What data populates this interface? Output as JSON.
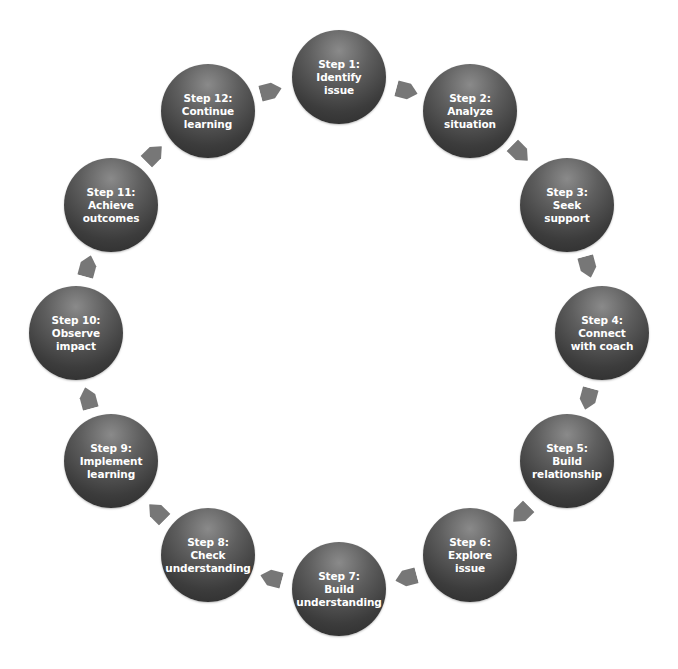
{
  "diagram": {
    "type": "cycle",
    "colors": {
      "circle_dark": "#2a2a2a",
      "circle_light": "#8a8a8a",
      "arrow": "#777777",
      "text": "#ffffff",
      "background": "#ffffff"
    },
    "steps": [
      {
        "title": "Step 1:",
        "line1": "Identify",
        "line2": "issue"
      },
      {
        "title": "Step 2:",
        "line1": "Analyze",
        "line2": "situation"
      },
      {
        "title": "Step 3:",
        "line1": "Seek",
        "line2": "support"
      },
      {
        "title": "Step 4:",
        "line1": "Connect",
        "line2": "with coach"
      },
      {
        "title": "Step 5:",
        "line1": "Build",
        "line2": "relationship"
      },
      {
        "title": "Step 6:",
        "line1": "Explore",
        "line2": "issue"
      },
      {
        "title": "Step 7:",
        "line1": "Build",
        "line2": "understanding"
      },
      {
        "title": "Step 8:",
        "line1": "Check",
        "line2": "understanding"
      },
      {
        "title": "Step 9:",
        "line1": "Implement",
        "line2": "learning"
      },
      {
        "title": "Step 10:",
        "line1": "Observe",
        "line2": "impact"
      },
      {
        "title": "Step 11:",
        "line1": "Achieve",
        "line2": "outcomes"
      },
      {
        "title": "Step 12:",
        "line1": "Continue",
        "line2": "learning"
      }
    ]
  }
}
